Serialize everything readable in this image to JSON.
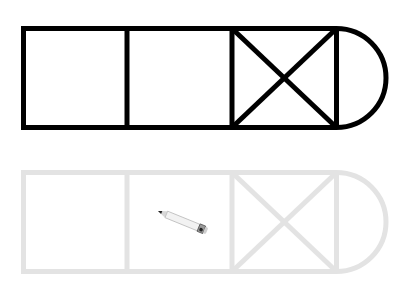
{
  "canvas": {
    "width": 414,
    "height": 288,
    "background": "#ffffff"
  },
  "reference_shape": {
    "label": "reference-outline",
    "stroke": "#000000",
    "stroke_width": 5,
    "top": 28.5,
    "bottom": 127.5,
    "left": 23.5,
    "dividers_x": [
      127,
      232,
      336.5
    ],
    "cross_cell": {
      "x1": 232,
      "x2": 336.5
    },
    "arc_end_x": 386.5
  },
  "trace_shape": {
    "label": "trace-outline",
    "stroke": "#e3e3e3",
    "stroke_width": 5,
    "top": 172.5,
    "bottom": 271.5,
    "left": 23.5,
    "dividers_x": [
      127,
      232,
      336.5
    ],
    "cross_cell": {
      "x1": 232,
      "x2": 336.5
    },
    "arc_end_x": 386.5
  },
  "pencil_cursor": {
    "tip_x": 158,
    "tip_y": 211,
    "end_x": 207,
    "end_y": 231
  }
}
